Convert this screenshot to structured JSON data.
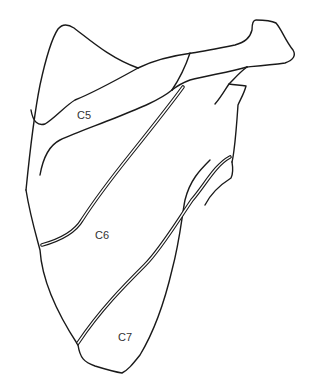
{
  "diagram": {
    "line_color": "#1a1a1a",
    "background": "#ffffff",
    "labels": [
      {
        "id": "c5",
        "text": "C5",
        "x": 77,
        "y": 110
      },
      {
        "id": "c6",
        "text": "C6",
        "x": 95,
        "y": 230
      },
      {
        "id": "c7",
        "text": "C7",
        "x": 118,
        "y": 332
      }
    ]
  }
}
